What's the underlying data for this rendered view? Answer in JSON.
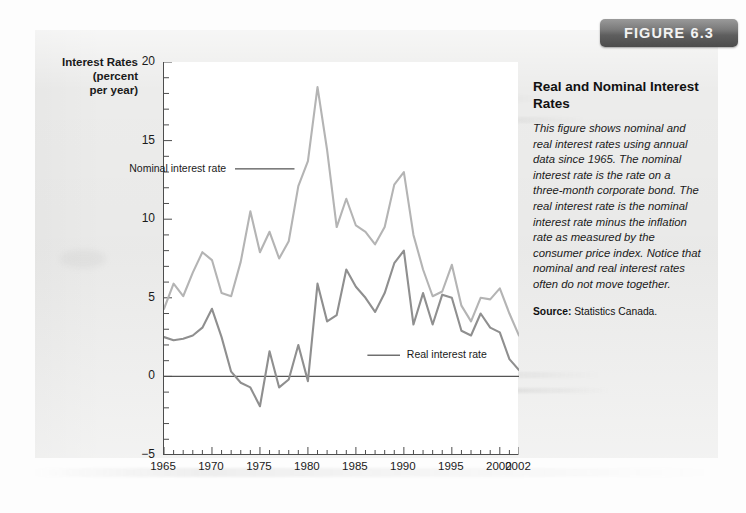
{
  "figure": {
    "badge_label": "FIGURE 6.3"
  },
  "caption": {
    "title": "Real and Nominal Interest Rates",
    "body": "This figure shows nominal and real interest rates using annual data since 1965. The nominal interest rate is the rate on a three-month corporate bond. The real interest rate is the nominal interest rate minus the inflation rate as measured by the consumer price index. Notice that nominal and real interest rates often do not move together.",
    "source_label": "Source:",
    "source_value": "Statistics Canada."
  },
  "chart_data": {
    "type": "line",
    "title": "Real and Nominal Interest Rates",
    "xlabel": "",
    "ylabel": "Interest Rates (percent per year)",
    "ylabel_lines": [
      "Interest Rates",
      "(percent",
      "per year)"
    ],
    "xlim": [
      1965,
      2002
    ],
    "ylim": [
      -5,
      20
    ],
    "y_ticks": [
      -5,
      0,
      5,
      10,
      15,
      20
    ],
    "y_tick_labels": [
      "−5",
      "0",
      "5",
      "10",
      "15",
      "20"
    ],
    "x_ticks": [
      1965,
      1970,
      1975,
      1980,
      1985,
      1990,
      1995,
      2000,
      2002
    ],
    "x_tick_labels": [
      "1965",
      "1970",
      "1975",
      "1980",
      "1985",
      "1990",
      "1995",
      "2000",
      "2002"
    ],
    "x_minor_step": 1,
    "y_minor_step": 1,
    "grid": false,
    "zero_line": 0,
    "legend": "in-plot-labels",
    "annotations": [
      {
        "text": "Nominal interest rate",
        "x": 1972.0,
        "y": 13.2,
        "leader_to_x": 1978.6,
        "leader_to_y": 13.2
      },
      {
        "text": "Real interest rate",
        "x": 1990.0,
        "y": 1.35,
        "leader_to_x": 1986.2,
        "leader_to_y": 1.35
      }
    ],
    "x": [
      1965,
      1966,
      1967,
      1968,
      1969,
      1970,
      1971,
      1972,
      1973,
      1974,
      1975,
      1976,
      1977,
      1978,
      1979,
      1980,
      1981,
      1982,
      1983,
      1984,
      1985,
      1986,
      1987,
      1988,
      1989,
      1990,
      1991,
      1992,
      1993,
      1994,
      1995,
      1996,
      1997,
      1998,
      1999,
      2000,
      2001,
      2002
    ],
    "series": [
      {
        "name": "Nominal interest rate",
        "color": "#b4b4b4",
        "values": [
          4.3,
          5.9,
          5.1,
          6.6,
          7.9,
          7.4,
          5.3,
          5.1,
          7.3,
          10.5,
          7.9,
          9.2,
          7.5,
          8.6,
          12.1,
          13.7,
          18.4,
          14.4,
          9.5,
          11.3,
          9.6,
          9.2,
          8.4,
          9.5,
          12.2,
          13.0,
          9.0,
          6.8,
          5.1,
          5.4,
          7.1,
          4.5,
          3.5,
          5.0,
          4.9,
          5.6,
          4.0,
          2.6
        ]
      },
      {
        "name": "Real interest rate",
        "color": "#8f8f8f",
        "values": [
          2.5,
          2.3,
          2.4,
          2.6,
          3.1,
          4.3,
          2.5,
          0.3,
          -0.4,
          -0.7,
          -1.9,
          1.6,
          -0.7,
          -0.2,
          2.0,
          -0.3,
          5.9,
          3.5,
          3.9,
          6.8,
          5.7,
          5.0,
          4.1,
          5.3,
          7.2,
          8.0,
          3.3,
          5.3,
          3.3,
          5.2,
          5.0,
          2.9,
          2.6,
          4.0,
          3.1,
          2.8,
          1.1,
          0.4
        ]
      }
    ]
  }
}
